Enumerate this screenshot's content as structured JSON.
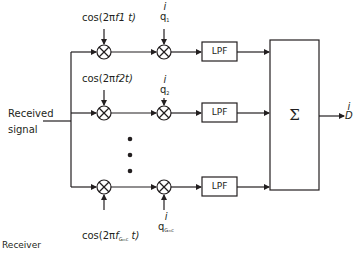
{
  "diagram": {
    "title": "Receiver",
    "input_label_line1": "Received",
    "input_label_line2": "signal",
    "branches": [
      {
        "carrier_label_pre": "cos(2π",
        "carrier_freq": "f1",
        "carrier_label_post": " t)",
        "code_top": "i",
        "code_symbol": "q",
        "code_sub": "1",
        "filter": "LPF"
      },
      {
        "carrier_label_pre": "cos(2π",
        "carrier_freq": "f2",
        "carrier_label_post": "t)",
        "code_top": "i",
        "code_symbol": "q",
        "code_sub": "2",
        "filter": "LPF"
      },
      {
        "carrier_label_pre": "cos(2π",
        "carrier_freq": "f",
        "carrier_sub": "Gₘc",
        "carrier_label_post": " t)",
        "code_top": "i",
        "code_symbol": "q",
        "code_sub": "Gₘc",
        "filter": "LPF"
      }
    ],
    "ellipsis": "⋮",
    "summer_symbol": "Σ",
    "output_top": "i",
    "output_symbol": "D",
    "line_color": "#231f20"
  }
}
